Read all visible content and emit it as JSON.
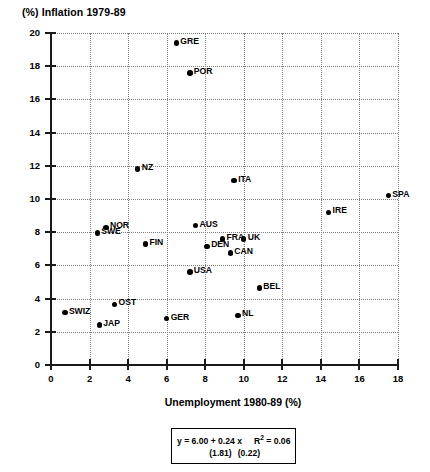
{
  "chart_data": {
    "type": "scatter",
    "title": "(%) Inflation 1979-89",
    "xlabel": "Unemployment 1980-89 (%)",
    "ylabel": "(%) Inflation 1979-89",
    "xlim": [
      0,
      18
    ],
    "ylim": [
      0,
      20
    ],
    "xticks": [
      0,
      2,
      4,
      6,
      8,
      10,
      12,
      14,
      16,
      18
    ],
    "yticks": [
      0,
      2,
      4,
      6,
      8,
      10,
      12,
      14,
      16,
      18,
      20
    ],
    "grid": true,
    "legend": "none",
    "points": [
      {
        "label": "GRE",
        "x": 6.5,
        "y": 19.4,
        "label_side": "right"
      },
      {
        "label": "POR",
        "x": 7.2,
        "y": 17.6,
        "label_side": "right"
      },
      {
        "label": "NZ",
        "x": 4.5,
        "y": 11.8,
        "label_side": "right"
      },
      {
        "label": "ITA",
        "x": 9.5,
        "y": 11.1,
        "label_side": "right"
      },
      {
        "label": "SPA",
        "x": 17.5,
        "y": 10.2,
        "label_side": "right"
      },
      {
        "label": "IRE",
        "x": 14.4,
        "y": 9.2,
        "label_side": "right"
      },
      {
        "label": "NOR",
        "x": 2.85,
        "y": 8.3,
        "label_side": "right"
      },
      {
        "label": "AUS",
        "x": 7.5,
        "y": 8.4,
        "label_side": "right"
      },
      {
        "label": "SWE",
        "x": 2.4,
        "y": 7.95,
        "label_side": "right"
      },
      {
        "label": "FRA",
        "x": 8.9,
        "y": 7.6,
        "label_side": "right"
      },
      {
        "label": "UK",
        "x": 10.0,
        "y": 7.6,
        "label_side": "right"
      },
      {
        "label": "FIN",
        "x": 4.9,
        "y": 7.3,
        "label_side": "right"
      },
      {
        "label": "DEN",
        "x": 8.1,
        "y": 7.15,
        "label_side": "right"
      },
      {
        "label": "CAN",
        "x": 9.3,
        "y": 6.75,
        "label_side": "right"
      },
      {
        "label": "USA",
        "x": 7.2,
        "y": 5.6,
        "label_side": "right"
      },
      {
        "label": "BEL",
        "x": 10.8,
        "y": 4.65,
        "label_side": "right"
      },
      {
        "label": "OST",
        "x": 3.3,
        "y": 3.65,
        "label_side": "right"
      },
      {
        "label": "SWIZ",
        "x": 0.72,
        "y": 3.15,
        "label_side": "right"
      },
      {
        "label": "NL",
        "x": 9.7,
        "y": 3.0,
        "label_side": "right"
      },
      {
        "label": "GER",
        "x": 6.0,
        "y": 2.8,
        "label_side": "right"
      },
      {
        "label": "JAP",
        "x": 2.5,
        "y": 2.4,
        "label_side": "right"
      }
    ],
    "annotation": {
      "equation_prefix": "y = 6.00 + 0.24 x",
      "r_squared_label": "R",
      "r_squared_sup": "2",
      "r_squared_value": " = 0.06",
      "std_error_intercept": "(1.81)",
      "std_error_slope": "(0.22)",
      "intercept": 6.0,
      "slope": 0.24,
      "r_squared": 0.06
    }
  },
  "style": {
    "axis_color": "#1a1a1a",
    "grid_color": "#7d7d7d",
    "point_color": "#000000",
    "background": "#ffffff"
  }
}
